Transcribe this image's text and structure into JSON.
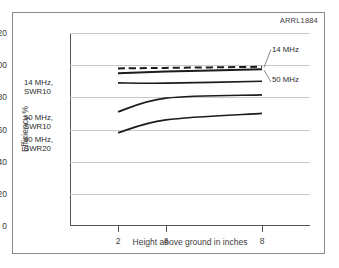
{
  "corner_label": "ARRL1884",
  "chart_data": {
    "type": "line",
    "title": "",
    "xlabel": "Height above ground in inches",
    "ylabel": "Efficiency %",
    "xlim": [
      0,
      10
    ],
    "ylim": [
      0,
      120
    ],
    "yticks": [
      0,
      20,
      40,
      60,
      80,
      100,
      120
    ],
    "xticks": [
      2,
      4,
      8
    ],
    "xtick_labels": [
      "2",
      "4",
      "8"
    ],
    "grid": "horizontal",
    "legend": "inline-annotations",
    "x": [
      2,
      4,
      8
    ],
    "series": [
      {
        "name": "14 MHz",
        "style": "dashed",
        "label_side": "right",
        "label_text": "14 MHz",
        "values": [
          98.0,
          98.3,
          99.0
        ]
      },
      {
        "name": "50 MHz",
        "style": "solid",
        "label_side": "right",
        "label_text": "50 MHz",
        "values": [
          95.0,
          96.0,
          97.5
        ]
      },
      {
        "name": "14 MHz, SWR10",
        "style": "solid",
        "label_side": "left",
        "label_text": "14 MHz,\nSWR10",
        "values": [
          89.0,
          88.8,
          90.0
        ]
      },
      {
        "name": "50 MHz, SWR10",
        "style": "solid",
        "label_side": "left",
        "label_text": "50 MHz,\nSWR10",
        "values": [
          71.0,
          79.5,
          81.5
        ]
      },
      {
        "name": "50 MHz, SWR20",
        "style": "solid",
        "label_side": "left",
        "label_text": "50 MHz,\nSWR20",
        "values": [
          58.0,
          66.0,
          70.0
        ]
      }
    ]
  }
}
